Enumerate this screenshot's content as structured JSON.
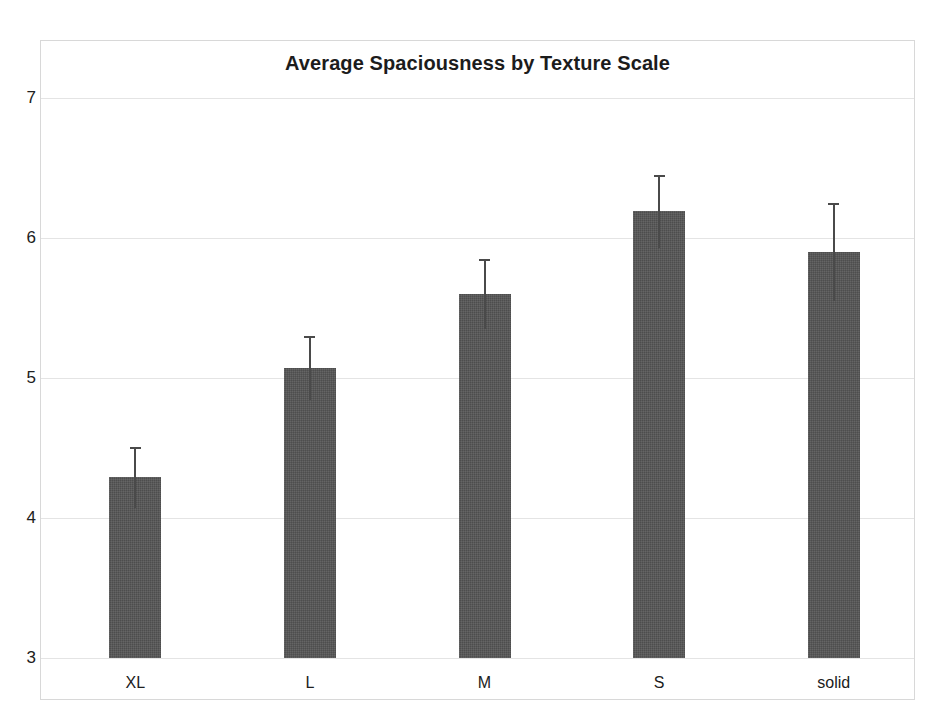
{
  "chart_data": {
    "type": "bar",
    "title": "Average Spaciousness by Texture Scale",
    "xlabel": "",
    "ylabel": "",
    "categories": [
      "XL",
      "L",
      "M",
      "S",
      "solid"
    ],
    "values": [
      4.29,
      5.07,
      5.6,
      6.19,
      5.9
    ],
    "error_high": [
      4.51,
      5.3,
      5.85,
      6.45,
      6.25
    ],
    "error_low": [
      4.07,
      4.84,
      5.35,
      5.93,
      5.55
    ],
    "ylim": [
      3,
      7
    ],
    "yticks": [
      3,
      4,
      5,
      6,
      7
    ],
    "ytick_labels": [
      "3",
      "4",
      "5",
      "6",
      "7"
    ],
    "grid": true,
    "legend": null,
    "bar_color": "#555555",
    "error_color": "#4a4a4a",
    "grid_color": "#e4e4e4",
    "frame_color": "#d8d8d8",
    "background": "#ffffff"
  }
}
